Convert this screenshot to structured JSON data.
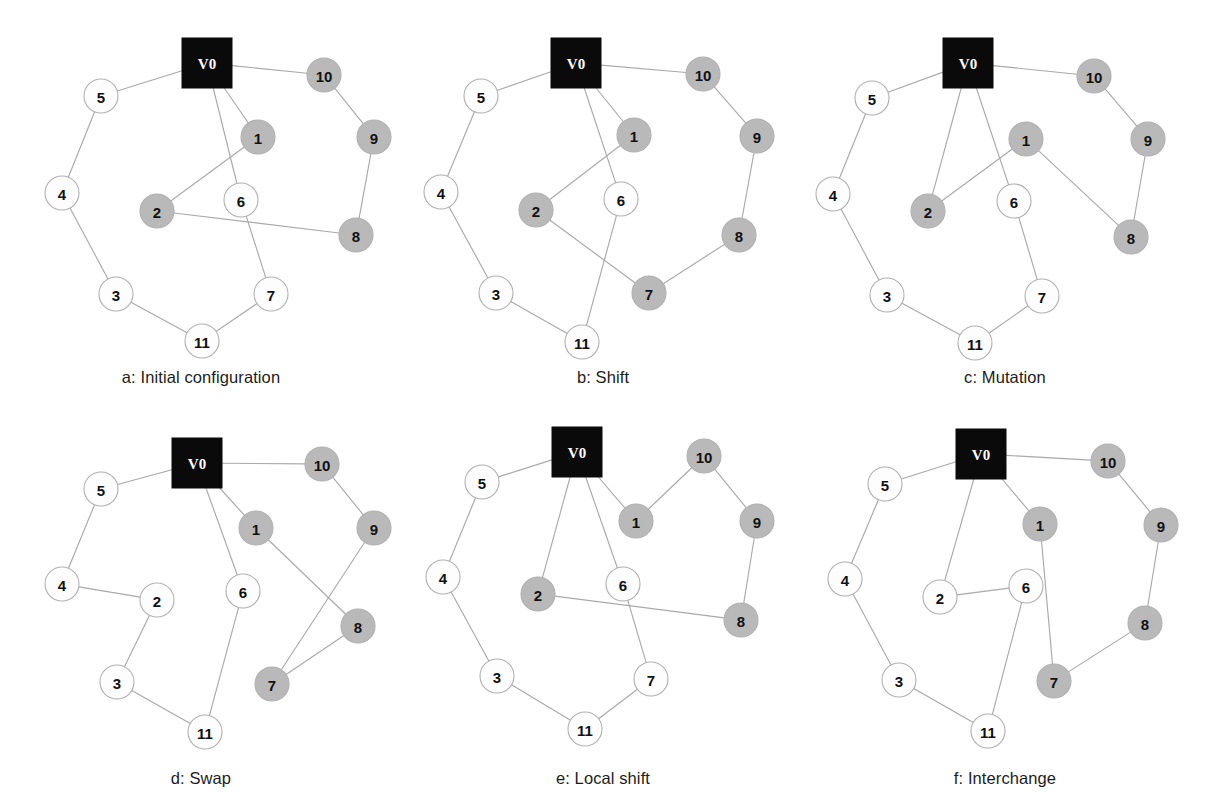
{
  "figure": {
    "colors": {
      "background": "#ffffff",
      "edge": "#a9a9a9",
      "node_white_fill": "#fdfdfd",
      "node_gray_fill": "#b9b9b9",
      "node_border": "#b0b0b0",
      "depot_fill": "#0a0a0a",
      "depot_label": "#ffffff",
      "label": "#111111",
      "caption": "#1c1c1c"
    },
    "depot_label": "V0",
    "node_radius": 17,
    "depot_size": 50
  },
  "chart_data": {
    "type": "diagram",
    "subtype": "node-link-graph-grid",
    "layout": {
      "rows": 2,
      "cols": 3,
      "panel_width": 402,
      "panel_height": 405
    },
    "legend": {
      "black_square": "depot V0",
      "gray_circle": "customer served by one route (shaded)",
      "white_circle": "customer served by the other route (unshaded)"
    },
    "panels": [
      {
        "id": "a",
        "caption": "a: Initial configuration",
        "caption_y": 368,
        "origin": {
          "x": 0,
          "y": 0
        },
        "depot": {
          "id": "V0",
          "label": "V0",
          "x": 207,
          "y": 63
        },
        "nodes": [
          {
            "id": "5",
            "label": "5",
            "x": 101,
            "y": 96,
            "shade": "white"
          },
          {
            "id": "10",
            "label": "10",
            "x": 324,
            "y": 75,
            "shade": "gray"
          },
          {
            "id": "1",
            "label": "1",
            "x": 258,
            "y": 137,
            "shade": "gray"
          },
          {
            "id": "9",
            "label": "9",
            "x": 374,
            "y": 137,
            "shade": "gray"
          },
          {
            "id": "4",
            "label": "4",
            "x": 62,
            "y": 193,
            "shade": "white"
          },
          {
            "id": "2",
            "label": "2",
            "x": 157,
            "y": 211,
            "shade": "gray"
          },
          {
            "id": "6",
            "label": "6",
            "x": 241,
            "y": 200,
            "shade": "white"
          },
          {
            "id": "8",
            "label": "8",
            "x": 356,
            "y": 235,
            "shade": "gray"
          },
          {
            "id": "3",
            "label": "3",
            "x": 116,
            "y": 294,
            "shade": "white"
          },
          {
            "id": "7",
            "label": "7",
            "x": 271,
            "y": 294,
            "shade": "white"
          },
          {
            "id": "11",
            "label": "11",
            "x": 202,
            "y": 341,
            "shade": "white"
          }
        ],
        "edges": [
          [
            "V0",
            "5"
          ],
          [
            "V0",
            "10"
          ],
          [
            "V0",
            "1"
          ],
          [
            "V0",
            "6"
          ],
          [
            "5",
            "4"
          ],
          [
            "4",
            "3"
          ],
          [
            "3",
            "11"
          ],
          [
            "11",
            "7"
          ],
          [
            "7",
            "6"
          ],
          [
            "1",
            "2"
          ],
          [
            "2",
            "8"
          ],
          [
            "8",
            "9"
          ],
          [
            "9",
            "10"
          ]
        ]
      },
      {
        "id": "b",
        "caption": "b: Shift",
        "caption_y": 368,
        "origin": {
          "x": 402,
          "y": 0
        },
        "depot": {
          "id": "V0",
          "label": "V0",
          "x": 174,
          "y": 63
        },
        "nodes": [
          {
            "id": "5",
            "label": "5",
            "x": 79,
            "y": 96,
            "shade": "white"
          },
          {
            "id": "10",
            "label": "10",
            "x": 301,
            "y": 74,
            "shade": "gray"
          },
          {
            "id": "1",
            "label": "1",
            "x": 232,
            "y": 135,
            "shade": "gray"
          },
          {
            "id": "9",
            "label": "9",
            "x": 355,
            "y": 136,
            "shade": "gray"
          },
          {
            "id": "4",
            "label": "4",
            "x": 39,
            "y": 192,
            "shade": "white"
          },
          {
            "id": "2",
            "label": "2",
            "x": 134,
            "y": 210,
            "shade": "gray"
          },
          {
            "id": "6",
            "label": "6",
            "x": 219,
            "y": 199,
            "shade": "white"
          },
          {
            "id": "8",
            "label": "8",
            "x": 337,
            "y": 235,
            "shade": "gray"
          },
          {
            "id": "3",
            "label": "3",
            "x": 94,
            "y": 293,
            "shade": "white"
          },
          {
            "id": "7",
            "label": "7",
            "x": 247,
            "y": 293,
            "shade": "gray"
          },
          {
            "id": "11",
            "label": "11",
            "x": 180,
            "y": 342,
            "shade": "white"
          }
        ],
        "edges": [
          [
            "V0",
            "5"
          ],
          [
            "V0",
            "10"
          ],
          [
            "V0",
            "1"
          ],
          [
            "V0",
            "6"
          ],
          [
            "5",
            "4"
          ],
          [
            "4",
            "3"
          ],
          [
            "3",
            "11"
          ],
          [
            "11",
            "6"
          ],
          [
            "1",
            "2"
          ],
          [
            "2",
            "7"
          ],
          [
            "7",
            "8"
          ],
          [
            "8",
            "9"
          ],
          [
            "9",
            "10"
          ]
        ]
      },
      {
        "id": "c",
        "caption": "c: Mutation",
        "caption_y": 368,
        "origin": {
          "x": 804,
          "y": 0
        },
        "depot": {
          "id": "V0",
          "label": "V0",
          "x": 164,
          "y": 63
        },
        "nodes": [
          {
            "id": "5",
            "label": "5",
            "x": 68,
            "y": 98,
            "shade": "white"
          },
          {
            "id": "10",
            "label": "10",
            "x": 290,
            "y": 76,
            "shade": "gray"
          },
          {
            "id": "1",
            "label": "1",
            "x": 222,
            "y": 139,
            "shade": "gray"
          },
          {
            "id": "9",
            "label": "9",
            "x": 344,
            "y": 139,
            "shade": "gray"
          },
          {
            "id": "4",
            "label": "4",
            "x": 29,
            "y": 194,
            "shade": "white"
          },
          {
            "id": "2",
            "label": "2",
            "x": 124,
            "y": 211,
            "shade": "gray"
          },
          {
            "id": "6",
            "label": "6",
            "x": 210,
            "y": 201,
            "shade": "white"
          },
          {
            "id": "8",
            "label": "8",
            "x": 327,
            "y": 237,
            "shade": "gray"
          },
          {
            "id": "3",
            "label": "3",
            "x": 83,
            "y": 295,
            "shade": "white"
          },
          {
            "id": "7",
            "label": "7",
            "x": 238,
            "y": 296,
            "shade": "white"
          },
          {
            "id": "11",
            "label": "11",
            "x": 171,
            "y": 343,
            "shade": "white"
          }
        ],
        "edges": [
          [
            "V0",
            "5"
          ],
          [
            "V0",
            "10"
          ],
          [
            "V0",
            "2"
          ],
          [
            "V0",
            "6"
          ],
          [
            "5",
            "4"
          ],
          [
            "4",
            "3"
          ],
          [
            "3",
            "11"
          ],
          [
            "11",
            "7"
          ],
          [
            "7",
            "6"
          ],
          [
            "2",
            "1"
          ],
          [
            "1",
            "8"
          ],
          [
            "8",
            "9"
          ],
          [
            "9",
            "10"
          ]
        ]
      },
      {
        "id": "d",
        "caption": "d: Swap",
        "caption_y": 769,
        "origin": {
          "x": 0,
          "y": 404
        },
        "depot": {
          "id": "V0",
          "label": "V0",
          "x": 197,
          "y": 59
        },
        "nodes": [
          {
            "id": "5",
            "label": "5",
            "x": 101,
            "y": 85,
            "shade": "white"
          },
          {
            "id": "10",
            "label": "10",
            "x": 322,
            "y": 60,
            "shade": "gray"
          },
          {
            "id": "1",
            "label": "1",
            "x": 256,
            "y": 124,
            "shade": "gray"
          },
          {
            "id": "9",
            "label": "9",
            "x": 374,
            "y": 124,
            "shade": "gray"
          },
          {
            "id": "4",
            "label": "4",
            "x": 62,
            "y": 180,
            "shade": "white"
          },
          {
            "id": "2",
            "label": "2",
            "x": 157,
            "y": 196,
            "shade": "white"
          },
          {
            "id": "6",
            "label": "6",
            "x": 243,
            "y": 187,
            "shade": "white"
          },
          {
            "id": "8",
            "label": "8",
            "x": 358,
            "y": 222,
            "shade": "gray"
          },
          {
            "id": "3",
            "label": "3",
            "x": 117,
            "y": 278,
            "shade": "white"
          },
          {
            "id": "7",
            "label": "7",
            "x": 272,
            "y": 280,
            "shade": "gray"
          },
          {
            "id": "11",
            "label": "11",
            "x": 205,
            "y": 328,
            "shade": "white"
          }
        ],
        "edges": [
          [
            "V0",
            "5"
          ],
          [
            "V0",
            "10"
          ],
          [
            "V0",
            "1"
          ],
          [
            "V0",
            "6"
          ],
          [
            "5",
            "4"
          ],
          [
            "4",
            "2"
          ],
          [
            "2",
            "3"
          ],
          [
            "3",
            "11"
          ],
          [
            "11",
            "6"
          ],
          [
            "1",
            "8"
          ],
          [
            "8",
            "7"
          ],
          [
            "7",
            "9"
          ],
          [
            "9",
            "10"
          ]
        ]
      },
      {
        "id": "e",
        "caption": "e: Local shift",
        "caption_y": 769,
        "origin": {
          "x": 402,
          "y": 404
        },
        "depot": {
          "id": "V0",
          "label": "V0",
          "x": 175,
          "y": 48
        },
        "nodes": [
          {
            "id": "5",
            "label": "5",
            "x": 80,
            "y": 78,
            "shade": "white"
          },
          {
            "id": "10",
            "label": "10",
            "x": 302,
            "y": 52,
            "shade": "gray"
          },
          {
            "id": "1",
            "label": "1",
            "x": 234,
            "y": 117,
            "shade": "gray"
          },
          {
            "id": "9",
            "label": "9",
            "x": 355,
            "y": 117,
            "shade": "gray"
          },
          {
            "id": "4",
            "label": "4",
            "x": 41,
            "y": 173,
            "shade": "white"
          },
          {
            "id": "2",
            "label": "2",
            "x": 136,
            "y": 190,
            "shade": "gray"
          },
          {
            "id": "6",
            "label": "6",
            "x": 221,
            "y": 180,
            "shade": "white"
          },
          {
            "id": "8",
            "label": "8",
            "x": 339,
            "y": 216,
            "shade": "gray"
          },
          {
            "id": "3",
            "label": "3",
            "x": 95,
            "y": 272,
            "shade": "white"
          },
          {
            "id": "7",
            "label": "7",
            "x": 249,
            "y": 275,
            "shade": "white"
          },
          {
            "id": "11",
            "label": "11",
            "x": 183,
            "y": 325,
            "shade": "white"
          }
        ],
        "edges": [
          [
            "V0",
            "5"
          ],
          [
            "V0",
            "1"
          ],
          [
            "V0",
            "2"
          ],
          [
            "V0",
            "6"
          ],
          [
            "5",
            "4"
          ],
          [
            "4",
            "3"
          ],
          [
            "3",
            "11"
          ],
          [
            "11",
            "7"
          ],
          [
            "7",
            "6"
          ],
          [
            "2",
            "8"
          ],
          [
            "8",
            "9"
          ],
          [
            "9",
            "10"
          ],
          [
            "10",
            "1"
          ]
        ]
      },
      {
        "id": "f",
        "caption": "f: Interchange",
        "caption_y": 769,
        "origin": {
          "x": 804,
          "y": 404
        },
        "depot": {
          "id": "V0",
          "label": "V0",
          "x": 177,
          "y": 50
        },
        "nodes": [
          {
            "id": "5",
            "label": "5",
            "x": 81,
            "y": 80,
            "shade": "white"
          },
          {
            "id": "10",
            "label": "10",
            "x": 304,
            "y": 57,
            "shade": "gray"
          },
          {
            "id": "1",
            "label": "1",
            "x": 236,
            "y": 120,
            "shade": "gray"
          },
          {
            "id": "9",
            "label": "9",
            "x": 357,
            "y": 121,
            "shade": "gray"
          },
          {
            "id": "4",
            "label": "4",
            "x": 41,
            "y": 175,
            "shade": "white"
          },
          {
            "id": "2",
            "label": "2",
            "x": 136,
            "y": 193,
            "shade": "white"
          },
          {
            "id": "6",
            "label": "6",
            "x": 222,
            "y": 182,
            "shade": "white"
          },
          {
            "id": "8",
            "label": "8",
            "x": 341,
            "y": 219,
            "shade": "gray"
          },
          {
            "id": "3",
            "label": "3",
            "x": 95,
            "y": 276,
            "shade": "white"
          },
          {
            "id": "7",
            "label": "7",
            "x": 250,
            "y": 277,
            "shade": "gray"
          },
          {
            "id": "11",
            "label": "11",
            "x": 184,
            "y": 327,
            "shade": "white"
          }
        ],
        "edges": [
          [
            "V0",
            "5"
          ],
          [
            "V0",
            "10"
          ],
          [
            "V0",
            "1"
          ],
          [
            "V0",
            "2"
          ],
          [
            "5",
            "4"
          ],
          [
            "4",
            "3"
          ],
          [
            "3",
            "11"
          ],
          [
            "11",
            "6"
          ],
          [
            "6",
            "2"
          ],
          [
            "1",
            "7"
          ],
          [
            "7",
            "8"
          ],
          [
            "8",
            "9"
          ],
          [
            "9",
            "10"
          ]
        ]
      }
    ]
  }
}
